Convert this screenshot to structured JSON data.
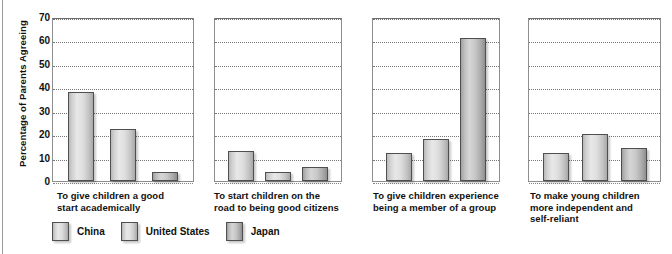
{
  "chart_data": {
    "type": "bar",
    "title": "",
    "xlabel": "",
    "ylabel": "Percentage of Parents Agreeing",
    "ylim": [
      0,
      70
    ],
    "ytick_step": 10,
    "yticks": [
      70,
      60,
      50,
      40,
      30,
      20,
      10,
      0
    ],
    "grid": true,
    "legend_position": "bottom-left",
    "panel_layout": "four side-by-side panels sharing one y-axis",
    "categories": [
      "To give children a good start academically",
      "To start children on the road to being good citizens",
      "To give children experience being a member of a group",
      "To make young children more independent and self-reliant"
    ],
    "category_lines": [
      [
        "To give children a good",
        "start academically"
      ],
      [
        "To start children on the",
        "road to being good citizens"
      ],
      [
        "To give children experience",
        "being a member of a group"
      ],
      [
        "To make young children",
        "more independent and",
        "self-reliant"
      ]
    ],
    "series": [
      {
        "name": "China",
        "values": [
          38,
          13,
          12,
          12
        ]
      },
      {
        "name": "United States",
        "values": [
          22,
          4,
          18,
          20
        ]
      },
      {
        "name": "Japan",
        "values": [
          4,
          6,
          61,
          14
        ]
      }
    ]
  },
  "legend": {
    "items": [
      {
        "label": "China",
        "swatch": "light-gray-gradient-swatch"
      },
      {
        "label": "United States",
        "swatch": "light-gray-gradient-swatch"
      },
      {
        "label": "Japan",
        "swatch": "dark-gray-gradient-swatch"
      }
    ]
  },
  "colors": {
    "bar_light": "#d8d8d8",
    "bar_dark": "#bcbcbc",
    "bar_border": "#4f4f4f",
    "gridline": "#5d5d5d",
    "panel_border": "#8e8e8e",
    "text": "#111111",
    "background": "#ffffff"
  }
}
